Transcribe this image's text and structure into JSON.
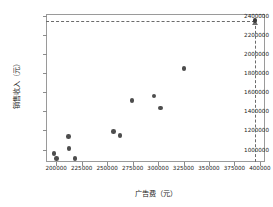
{
  "chart_data": {
    "type": "scatter",
    "title": "",
    "xlabel": "广告费（元）",
    "ylabel": "销售收入（元）",
    "xlim": [
      190000,
      405000
    ],
    "ylim": [
      870000,
      2420000
    ],
    "grid": false,
    "legend": "none",
    "x_ticks": [
      200000,
      225000,
      250000,
      275000,
      300000,
      325000,
      350000,
      375000,
      400000
    ],
    "x_tick_labels": [
      "200000",
      "225000",
      "250000",
      "275000",
      "300000",
      "325000",
      "350000",
      "375000",
      "400000"
    ],
    "y_ticks": [
      1000000,
      1200000,
      1400000,
      1600000,
      1800000,
      2000000,
      2200000,
      2400000
    ],
    "y_tick_labels": [
      "1000000",
      "1200000",
      "1400000",
      "1600000",
      "1800000",
      "2000000",
      "2200000",
      "2400000"
    ],
    "series": [
      {
        "name": "观测数据",
        "marker": "circle",
        "color": "#4d4d4d",
        "points": [
          {
            "x": 198000,
            "y": 962000
          },
          {
            "x": 200500,
            "y": 905000
          },
          {
            "x": 212000,
            "y": 1138000
          },
          {
            "x": 212500,
            "y": 1012000
          },
          {
            "x": 218500,
            "y": 908000
          },
          {
            "x": 256000,
            "y": 1188000
          },
          {
            "x": 262500,
            "y": 1148000
          },
          {
            "x": 274500,
            "y": 1512000
          },
          {
            "x": 296000,
            "y": 1562000
          },
          {
            "x": 302500,
            "y": 1435000
          },
          {
            "x": 325500,
            "y": 1848000
          }
        ]
      },
      {
        "name": "预测点",
        "marker": "circle+triangle",
        "color": "#3a3a3a",
        "points": [
          {
            "x": 395000,
            "y": 2350000
          }
        ]
      }
    ],
    "annotations": [
      {
        "type": "hline",
        "y": 2350000,
        "style": "dashed",
        "color": "#6b6b6b",
        "from_x": 190000,
        "to_x": 395000
      },
      {
        "type": "vline",
        "x": 395000,
        "style": "dashed",
        "color": "#6b6b6b",
        "from_y": 870000,
        "to_y": 2350000
      }
    ]
  }
}
